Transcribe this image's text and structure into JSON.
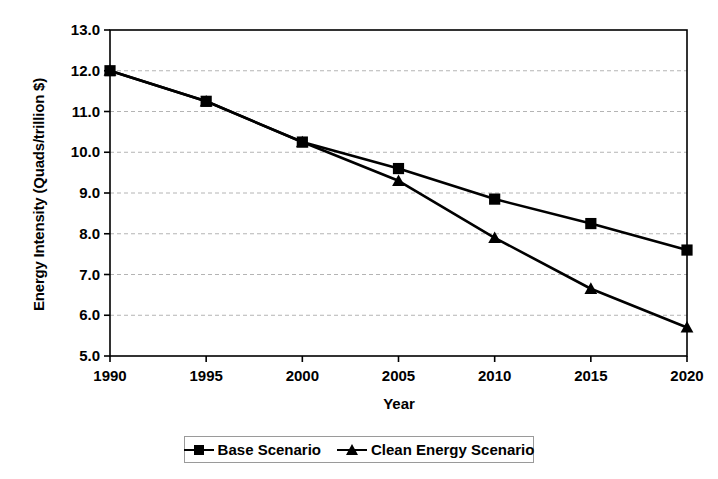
{
  "chart_data": {
    "type": "line",
    "title": "",
    "xlabel": "Year",
    "ylabel": "Energy Intensity (Quads/trillion $)",
    "categories": [
      "1990",
      "1995",
      "2000",
      "2005",
      "2010",
      "2015",
      "2020"
    ],
    "x": [
      1990,
      1995,
      2000,
      2005,
      2010,
      2015,
      2020
    ],
    "xlim": [
      1990,
      2020
    ],
    "ylim": [
      5.0,
      13.0
    ],
    "ytick_labels": [
      "13.0",
      "12.0",
      "11.0",
      "10.0",
      "9.0",
      "8.0",
      "7.0",
      "6.0",
      "5.0"
    ],
    "yticks": [
      13.0,
      12.0,
      11.0,
      10.0,
      9.0,
      8.0,
      7.0,
      6.0,
      5.0
    ],
    "grid": true,
    "grid_axis": "y",
    "legend_position": "bottom",
    "series": [
      {
        "name": "Base Scenario",
        "marker": "square",
        "values": [
          12.0,
          11.25,
          10.25,
          9.6,
          8.85,
          8.25,
          7.6
        ]
      },
      {
        "name": "Clean Energy Scenario",
        "marker": "triangle",
        "values": [
          12.0,
          11.25,
          10.25,
          9.3,
          7.9,
          6.65,
          5.7
        ]
      }
    ]
  },
  "colors": {
    "line": "#000000",
    "marker": "#000000",
    "grid": "#b4b4b4",
    "axis": "#000000",
    "background": "#ffffff"
  }
}
